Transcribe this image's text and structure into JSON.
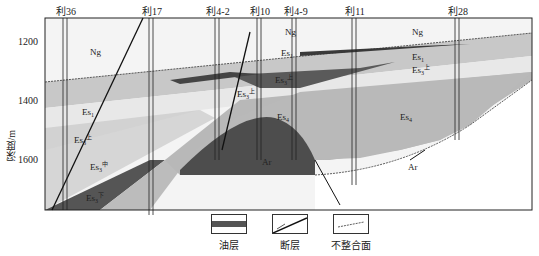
{
  "figure": {
    "type": "geological cross-section",
    "y_axis": {
      "label": "深度/m",
      "ticks": [
        "1200",
        "1400",
        "1600"
      ]
    },
    "wells": [
      {
        "name": "利36",
        "x": 66
      },
      {
        "name": "利17",
        "x": 152
      },
      {
        "name": "利4-2",
        "x": 218
      },
      {
        "name": "利10",
        "x": 260
      },
      {
        "name": "利4-9",
        "x": 296
      },
      {
        "name": "利11",
        "x": 355
      },
      {
        "name": "利28",
        "x": 458
      }
    ],
    "strata_labels": [
      {
        "text": "Ng",
        "sub": "",
        "sup": "",
        "x": 90,
        "y": 55
      },
      {
        "text": "Ng",
        "sub": "",
        "sup": "",
        "x": 285,
        "y": 35
      },
      {
        "text": "Ng",
        "sub": "",
        "sup": "",
        "x": 412,
        "y": 35
      },
      {
        "text": "Es",
        "sub": "1",
        "sup": "",
        "x": 281,
        "y": 56
      },
      {
        "text": "Es",
        "sub": "1",
        "sup": "",
        "x": 412,
        "y": 60
      },
      {
        "text": "Es",
        "sub": "3",
        "sup": "上",
        "x": 412,
        "y": 73
      },
      {
        "text": "Es",
        "sub": "3",
        "sup": "上",
        "x": 237,
        "y": 97
      },
      {
        "text": "Es",
        "sub": "3",
        "sup": "上",
        "x": 275,
        "y": 83
      },
      {
        "text": "Es",
        "sub": "1",
        "sup": "",
        "x": 82,
        "y": 115
      },
      {
        "text": "Es",
        "sub": "3",
        "sup": "上",
        "x": 74,
        "y": 143
      },
      {
        "text": "Es",
        "sub": "3",
        "sup": "中",
        "x": 90,
        "y": 170
      },
      {
        "text": "Es",
        "sub": "3",
        "sup": "下",
        "x": 86,
        "y": 201
      },
      {
        "text": "Es",
        "sub": "4",
        "sup": "",
        "x": 277,
        "y": 120
      },
      {
        "text": "Es",
        "sub": "4",
        "sup": "",
        "x": 400,
        "y": 120
      },
      {
        "text": "Ar",
        "sub": "",
        "sup": "",
        "x": 262,
        "y": 165
      },
      {
        "text": "Ar",
        "sub": "",
        "sup": "",
        "x": 408,
        "y": 170
      }
    ],
    "legend": [
      {
        "name": "oil-layer",
        "label": "油层"
      },
      {
        "name": "fault",
        "label": "断层"
      },
      {
        "name": "unconformity",
        "label": "不整合面"
      }
    ],
    "colors": {
      "ng": "#f2f2f2",
      "es1": "#c9c9c9",
      "es3_upper": "#e6e6e6",
      "es3_mid": "#d0d0d0",
      "es4": "#b8b8b8",
      "oil": "#555555",
      "ar": "#4a4a4a",
      "frame": "#222222"
    }
  }
}
